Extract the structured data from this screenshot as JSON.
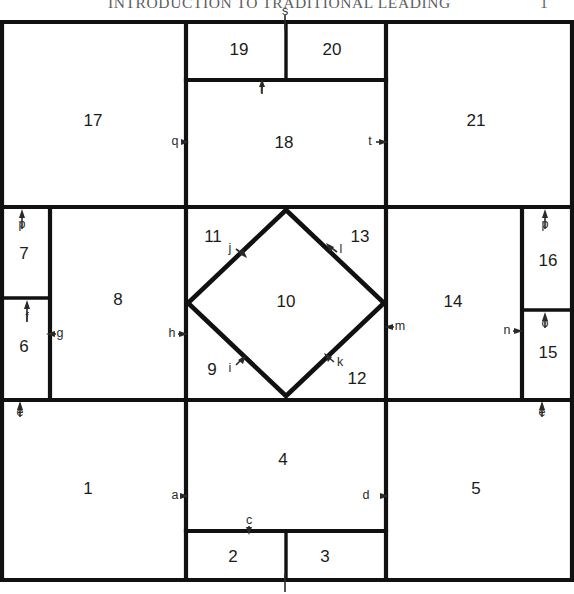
{
  "running_head": {
    "title": "INTRODUCTION TO TRADITIONAL LEADING",
    "page_number": "1"
  },
  "diagram": {
    "caption": "Twenty-one region rectangular chart with central diamond",
    "line_color": "#111111",
    "background": "#ffffff",
    "cells": [
      {
        "id": "cell-1",
        "label": "1",
        "cx": 88,
        "cy": 490
      },
      {
        "id": "cell-2",
        "label": "2",
        "cx": 233,
        "cy": 558
      },
      {
        "id": "cell-3",
        "label": "3",
        "cx": 325,
        "cy": 558
      },
      {
        "id": "cell-4",
        "label": "4",
        "cx": 283,
        "cy": 461
      },
      {
        "id": "cell-5",
        "label": "5",
        "cx": 476,
        "cy": 490
      },
      {
        "id": "cell-6",
        "label": "6",
        "cx": 24,
        "cy": 348
      },
      {
        "id": "cell-7",
        "label": "7",
        "cx": 24,
        "cy": 255
      },
      {
        "id": "cell-8",
        "label": "8",
        "cx": 118,
        "cy": 301
      },
      {
        "id": "cell-9",
        "label": "9",
        "cx": 212,
        "cy": 371
      },
      {
        "id": "cell-10",
        "label": "10",
        "cx": 286,
        "cy": 303
      },
      {
        "id": "cell-11",
        "label": "11",
        "cx": 213,
        "cy": 238
      },
      {
        "id": "cell-12",
        "label": "12",
        "cx": 357,
        "cy": 380
      },
      {
        "id": "cell-13",
        "label": "13",
        "cx": 360,
        "cy": 238
      },
      {
        "id": "cell-14",
        "label": "14",
        "cx": 453,
        "cy": 303
      },
      {
        "id": "cell-15",
        "label": "15",
        "cx": 548,
        "cy": 354
      },
      {
        "id": "cell-16",
        "label": "16",
        "cx": 548,
        "cy": 262
      },
      {
        "id": "cell-17",
        "label": "17",
        "cx": 93,
        "cy": 122
      },
      {
        "id": "cell-18",
        "label": "18",
        "cx": 284,
        "cy": 144
      },
      {
        "id": "cell-19",
        "label": "19",
        "cx": 239,
        "cy": 51
      },
      {
        "id": "cell-20",
        "label": "20",
        "cx": 332,
        "cy": 51
      },
      {
        "id": "cell-21",
        "label": "21",
        "cx": 476,
        "cy": 122
      }
    ],
    "edge_labels": [
      {
        "id": "label-a",
        "label": "a",
        "tx": 175,
        "ty": 496,
        "dir": "right"
      },
      {
        "id": "label-b",
        "label": "",
        "tx": 285,
        "ty": 590,
        "dir": "up"
      },
      {
        "id": "label-c",
        "label": "c",
        "tx": 249,
        "ty": 521,
        "dir": "down"
      },
      {
        "id": "label-d",
        "label": "d",
        "tx": 366,
        "ty": 496,
        "dir": "right"
      },
      {
        "id": "label-e-left",
        "label": "e",
        "tx": 20,
        "ty": 410,
        "dir": "up"
      },
      {
        "id": "label-e-right",
        "label": "e",
        "tx": 542,
        "ty": 410,
        "dir": "up"
      },
      {
        "id": "label-f",
        "label": "f",
        "tx": 27,
        "ty": 315,
        "dir": "up"
      },
      {
        "id": "label-g",
        "label": "g",
        "tx": 60,
        "ty": 334,
        "dir": "left"
      },
      {
        "id": "label-h",
        "label": "h",
        "tx": 172,
        "ty": 334,
        "dir": "right"
      },
      {
        "id": "label-i",
        "label": "i",
        "tx": 233,
        "ty": 369,
        "dir": "upright"
      },
      {
        "id": "label-j",
        "label": "j",
        "tx": 232,
        "ty": 251,
        "dir": "rightdown"
      },
      {
        "id": "label-k",
        "label": "k",
        "tx": 337,
        "ty": 364,
        "dir": "leftup"
      },
      {
        "id": "label-l",
        "label": "l",
        "tx": 340,
        "ty": 251,
        "dir": "leftdown"
      },
      {
        "id": "label-m",
        "label": "m",
        "tx": 398,
        "ty": 327,
        "dir": "left"
      },
      {
        "id": "label-n",
        "label": "n",
        "tx": 508,
        "ty": 331,
        "dir": "right"
      },
      {
        "id": "label-o",
        "label": "o",
        "tx": 545,
        "ty": 321,
        "dir": "up"
      },
      {
        "id": "label-p-left",
        "label": "p",
        "tx": 22,
        "ty": 222,
        "dir": "up"
      },
      {
        "id": "label-p-right",
        "label": "p",
        "tx": 545,
        "ty": 222,
        "dir": "up"
      },
      {
        "id": "label-q",
        "label": "q",
        "tx": 176,
        "ty": 142,
        "dir": "right"
      },
      {
        "id": "label-r",
        "label": "r",
        "tx": 262,
        "ty": 88,
        "dir": "up"
      },
      {
        "id": "label-s",
        "label": "s",
        "tx": 285,
        "ty": 12,
        "dir": "down"
      },
      {
        "id": "label-t",
        "label": "t",
        "tx": 370,
        "ty": 142,
        "dir": "right"
      }
    ]
  }
}
